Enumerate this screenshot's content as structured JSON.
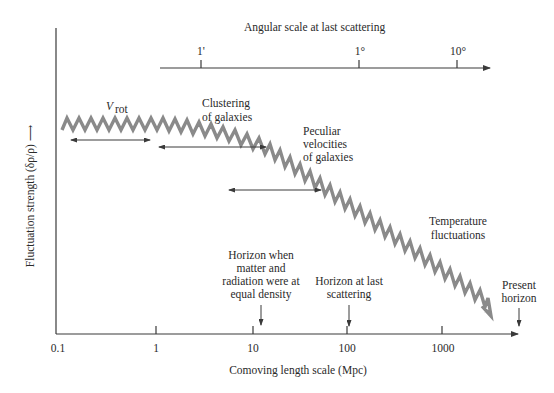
{
  "top_axis": {
    "title": "Angular scale at last scattering",
    "ticks": [
      {
        "label": "1'",
        "x": 201
      },
      {
        "label": "1°",
        "x": 359
      },
      {
        "label": "10°",
        "x": 457
      }
    ]
  },
  "y_axis": {
    "label": "Fluctuation strength (δρ/ρ) ⟶"
  },
  "x_axis": {
    "title": "Comoving length scale (Mpc)",
    "ticks": [
      {
        "label": "0.1",
        "x": 56
      },
      {
        "label": "1",
        "x": 156
      },
      {
        "label": "10",
        "x": 253
      },
      {
        "label": "100",
        "x": 347
      },
      {
        "label": "1000",
        "x": 442
      }
    ]
  },
  "annotations": {
    "vrot": {
      "main": "V",
      "sub": "rot"
    },
    "clustering": [
      "Clustering",
      "of galaxies"
    ],
    "peculiar": [
      "Peculiar",
      "velocities",
      "of galaxies"
    ],
    "temperature": [
      "Temperature",
      "fluctuations"
    ],
    "horizon_equal": [
      "Horizon when",
      "matter and",
      "radiation were at",
      "equal density"
    ],
    "horizon_last": [
      "Horizon at last",
      "scattering"
    ],
    "present_horizon": [
      "Present",
      "horizon"
    ]
  },
  "colors": {
    "zigzag": "#8a8a8a",
    "axis": "#3a3a3a",
    "text": "#2a2a2a"
  }
}
